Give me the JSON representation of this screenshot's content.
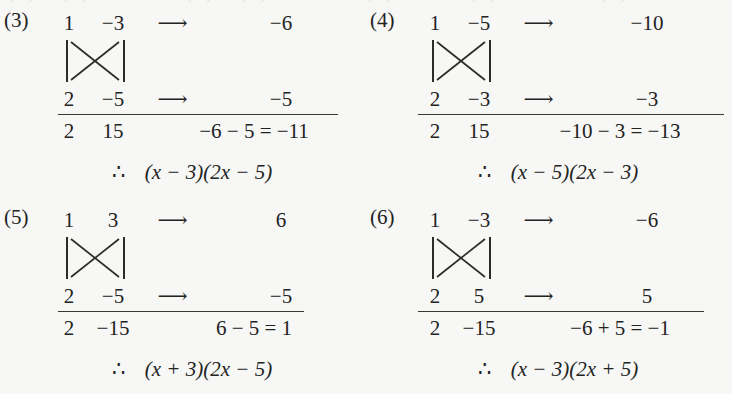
{
  "page": {
    "background_color": "#f7f7f5",
    "text_color": "#23231f",
    "top_cutoff_text": "(1)  (2)        (3)  (4)"
  },
  "symbols": {
    "arrow": "⟶",
    "therefore": "∴",
    "minus": "−",
    "cross_icon": "cross-multiplication-x"
  },
  "problems": [
    {
      "tag": "(3)",
      "row1": {
        "a": "1",
        "b": "−3",
        "arrow": "⟶",
        "product": "−6"
      },
      "row2": {
        "a": "2",
        "b": "−5",
        "arrow": "⟶",
        "product": "−5"
      },
      "sum": {
        "a": "2",
        "b": "15",
        "expression": "−6 − 5 = −11"
      },
      "conclusion": {
        "therefore": "∴",
        "factor1": "(x − 3)",
        "factor2": "(2x − 5)"
      }
    },
    {
      "tag": "(4)",
      "row1": {
        "a": "1",
        "b": "−5",
        "arrow": "⟶",
        "product": "−10"
      },
      "row2": {
        "a": "2",
        "b": "−3",
        "arrow": "⟶",
        "product": "−3"
      },
      "sum": {
        "a": "2",
        "b": "15",
        "expression": "−10 − 3 = −13"
      },
      "conclusion": {
        "therefore": "∴",
        "factor1": "(x − 5)",
        "factor2": "(2x − 3)"
      }
    },
    {
      "tag": "(5)",
      "row1": {
        "a": "1",
        "b": "3",
        "arrow": "⟶",
        "product": "6"
      },
      "row2": {
        "a": "2",
        "b": "−5",
        "arrow": "⟶",
        "product": "−5"
      },
      "sum": {
        "a": "2",
        "b": "−15",
        "expression": "6 − 5 = 1"
      },
      "conclusion": {
        "therefore": "∴",
        "factor1": "(x + 3)",
        "factor2": "(2x − 5)"
      }
    },
    {
      "tag": "(6)",
      "row1": {
        "a": "1",
        "b": "−3",
        "arrow": "⟶",
        "product": "−6"
      },
      "row2": {
        "a": "2",
        "b": "5",
        "arrow": "⟶",
        "product": "5"
      },
      "sum": {
        "a": "2",
        "b": "−15",
        "expression": "−6 + 5 = −1"
      },
      "conclusion": {
        "therefore": "∴",
        "factor1": "(x − 3)",
        "factor2": "(2x + 5)"
      }
    }
  ]
}
